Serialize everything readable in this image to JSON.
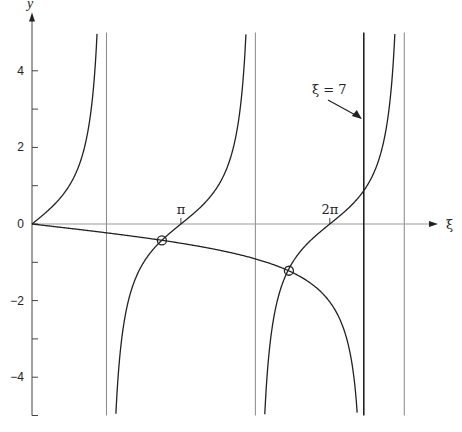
{
  "chart_data": {
    "type": "line",
    "title": "",
    "xlabel": "ξ",
    "ylabel": "y",
    "xlim": [
      0,
      8.5
    ],
    "ylim": [
      -5,
      5
    ],
    "grid": false,
    "x_ticks": [
      {
        "value": 3.14159,
        "label": "π"
      },
      {
        "value": 6.28319,
        "label": "2π"
      }
    ],
    "y_ticks": [
      {
        "value": 4,
        "label": "4"
      },
      {
        "value": 3,
        "label": ""
      },
      {
        "value": 2,
        "label": "2"
      },
      {
        "value": 1,
        "label": ""
      },
      {
        "value": 0,
        "label": "0"
      },
      {
        "value": -1,
        "label": ""
      },
      {
        "value": -2,
        "label": "−2"
      },
      {
        "value": -3,
        "label": ""
      },
      {
        "value": -4,
        "label": "−4"
      },
      {
        "value": -5,
        "label": ""
      }
    ],
    "series": [
      {
        "name": "tan ξ",
        "expr": "tan(xi)",
        "branches": [
          [
            0,
            1.571
          ],
          [
            1.571,
            4.712
          ],
          [
            4.712,
            7.854
          ]
        ]
      },
      {
        "name": "−ξ/√(49−ξ²)",
        "expr": "-xi/sqrt(49-xi^2)",
        "domain": [
          0,
          7
        ]
      }
    ],
    "asymptotes": [
      1.5708,
      4.7124,
      7.854
    ],
    "marked_line": {
      "value": 7,
      "label": "ξ = 7"
    },
    "intersections": [
      {
        "x": 2.74,
        "y": -0.43
      },
      {
        "x": 5.42,
        "y": -1.22
      }
    ],
    "annotations": [
      {
        "text": "ξ = 7",
        "arrow_to": [
          7,
          1.8
        ]
      }
    ]
  }
}
